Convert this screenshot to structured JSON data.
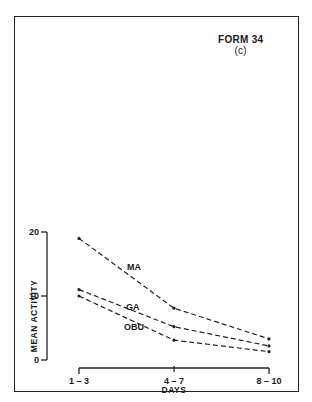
{
  "form": {
    "title": "FORM 34",
    "subtitle": "(c)"
  },
  "chart_data": {
    "type": "line",
    "title": "",
    "xlabel": "DAYS",
    "ylabel": "MEAN ACTIVITY",
    "categories": [
      "1 – 3",
      "4 – 7",
      "8 – 10"
    ],
    "yticks": [
      "0",
      "10",
      "20"
    ],
    "ylim": [
      0,
      20
    ],
    "grid": false,
    "line_style": "dashed",
    "legend_position": "inline labels",
    "series": [
      {
        "name": "MA",
        "values": [
          19,
          8.1,
          3.3
        ]
      },
      {
        "name": "GA",
        "values": [
          11,
          5.2,
          2.2
        ]
      },
      {
        "name": "OBU",
        "values": [
          10,
          3.1,
          1.3
        ]
      }
    ]
  }
}
